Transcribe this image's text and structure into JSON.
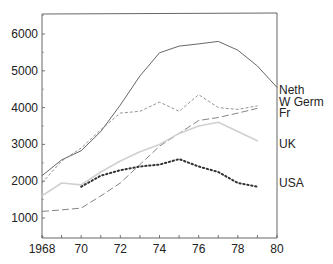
{
  "chart_data": {
    "type": "line",
    "title": "",
    "xlabel": "",
    "ylabel": "",
    "xlim": [
      1968,
      1980
    ],
    "ylim": [
      500,
      6500
    ],
    "grid": false,
    "legend_position": "right, inline labels at line ends",
    "x_ticks": [
      {
        "value": 1968,
        "label": "1968"
      },
      {
        "value": 1970,
        "label": "70"
      },
      {
        "value": 1972,
        "label": "72"
      },
      {
        "value": 1974,
        "label": "74"
      },
      {
        "value": 1976,
        "label": "76"
      },
      {
        "value": 1978,
        "label": "78"
      },
      {
        "value": 1980,
        "label": "80"
      }
    ],
    "y_ticks": [
      {
        "value": 1000,
        "label": "1000"
      },
      {
        "value": 2000,
        "label": "2000"
      },
      {
        "value": 3000,
        "label": "3000"
      },
      {
        "value": 4000,
        "label": "4000"
      },
      {
        "value": 5000,
        "label": "5000"
      },
      {
        "value": 6000,
        "label": "6000"
      }
    ],
    "series": [
      {
        "name": "Neth",
        "style": "solid",
        "color": "#555555",
        "x": [
          1968,
          1969,
          1970,
          1971,
          1972,
          1973,
          1974,
          1975,
          1976,
          1977,
          1978,
          1979,
          1980
        ],
        "values": [
          2150,
          2580,
          2830,
          3350,
          4070,
          4860,
          5490,
          5670,
          5730,
          5800,
          5560,
          5130,
          4550
        ]
      },
      {
        "name": "W Germ",
        "style": "short-dash",
        "color": "#888888",
        "x": [
          1968,
          1969,
          1970,
          1971,
          1972,
          1973,
          1974,
          1975,
          1976,
          1977,
          1978,
          1979
        ],
        "values": [
          1950,
          2550,
          2900,
          3400,
          3850,
          3900,
          4150,
          3900,
          4350,
          4000,
          3950,
          4050
        ]
      },
      {
        "name": "Fr",
        "style": "long-dash",
        "color": "#777777",
        "x": [
          1968,
          1969,
          1970,
          1971,
          1972,
          1973,
          1974,
          1975,
          1976,
          1977,
          1978,
          1979
        ],
        "values": [
          1180,
          1220,
          1270,
          1600,
          1950,
          2450,
          2950,
          3300,
          3650,
          3730,
          3850,
          3980
        ]
      },
      {
        "name": "UK",
        "style": "light-solid",
        "color": "#d0d0d0",
        "x": [
          1968,
          1969,
          1970,
          1971,
          1972,
          1973,
          1974,
          1975,
          1976,
          1977,
          1978,
          1979
        ],
        "values": [
          1600,
          1950,
          1900,
          2250,
          2550,
          2800,
          3000,
          3300,
          3500,
          3600,
          3350,
          3100
        ]
      },
      {
        "name": "USA",
        "style": "heavy-dotted",
        "color": "#333333",
        "x": [
          1970,
          1971,
          1972,
          1973,
          1974,
          1975,
          1976,
          1977,
          1978,
          1979
        ],
        "values": [
          1850,
          2150,
          2300,
          2400,
          2450,
          2600,
          2400,
          2250,
          1950,
          1850
        ]
      }
    ],
    "legend": [
      {
        "label": "Neth",
        "y_value": 4480
      },
      {
        "label": "W Germ",
        "y_value": 4160
      },
      {
        "label": "Fr",
        "y_value": 3840
      },
      {
        "label": "UK",
        "y_value": 3000
      },
      {
        "label": "USA",
        "y_value": 1950
      }
    ]
  }
}
